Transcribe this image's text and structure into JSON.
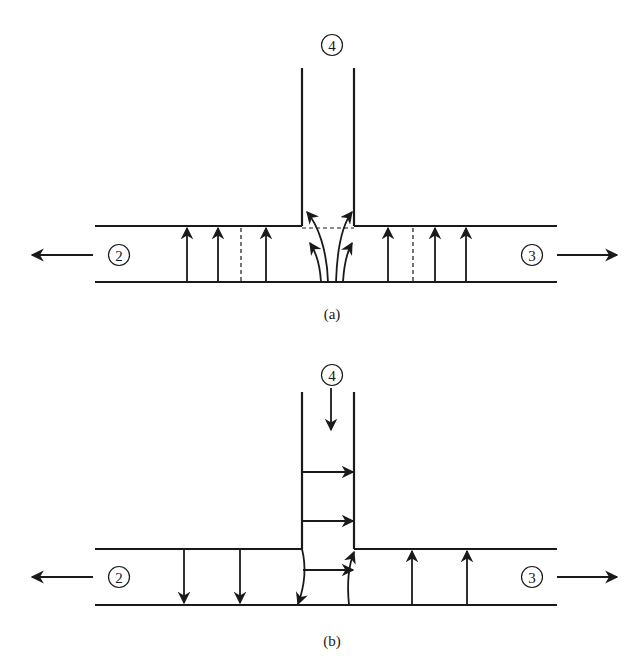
{
  "diagram": {
    "stroke_color": "#1a1a1a",
    "background": "#ffffff",
    "panels": [
      {
        "id": "a",
        "caption": "(a)",
        "branch_label": "4",
        "left_label": "2",
        "right_label": "3",
        "description": "Flow from main pipe turning up into branch 4; flow exits toward 2 and 3"
      },
      {
        "id": "b",
        "caption": "(b)",
        "branch_label": "4",
        "left_label": "2",
        "right_label": "3",
        "description": "Flow entering from branch 4 downward, splitting toward 2 and 3"
      }
    ]
  }
}
